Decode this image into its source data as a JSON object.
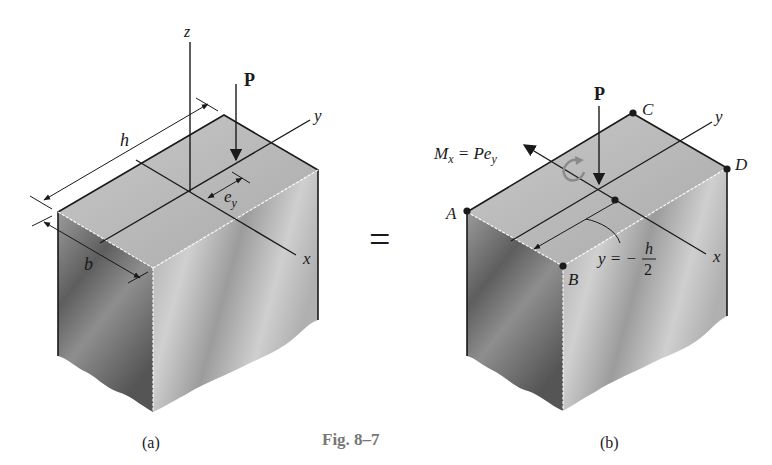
{
  "figure": {
    "caption": "Fig. 8–7",
    "equals_sign": "=",
    "colors": {
      "top_face": "#b8b8b8",
      "left_face_dark": "#6e6e6e",
      "right_face": "#c4c4c4",
      "line": "#1a1a1a",
      "caption_gray": "#777777",
      "moment_arrow": "#8a8a8a"
    }
  },
  "panel_a": {
    "label": "(a)",
    "axes": {
      "z": "z",
      "y": "y",
      "x": "x"
    },
    "load": "P",
    "dimensions": {
      "h": "h",
      "b": "b",
      "eccentricity_base": "e",
      "eccentricity_sub": "y"
    }
  },
  "panel_b": {
    "label": "(b)",
    "axes": {
      "y": "y",
      "x": "x"
    },
    "load": "P",
    "moment": {
      "symbol": "M",
      "sub": "x",
      "eq": " = P",
      "e": "e",
      "e_sub": "y"
    },
    "points": [
      "A",
      "B",
      "C",
      "D"
    ],
    "distance_label": {
      "lhs": "y = −",
      "num": "h",
      "den": "2"
    }
  }
}
